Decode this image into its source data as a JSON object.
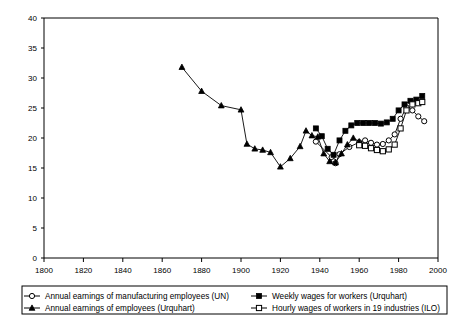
{
  "chart_data": {
    "type": "line",
    "title": "",
    "xlabel": "",
    "ylabel": "",
    "xlim": [
      1800,
      2000
    ],
    "ylim": [
      0,
      40
    ],
    "xticks": [
      1800,
      1820,
      1840,
      1860,
      1880,
      1900,
      1920,
      1940,
      1960,
      1980,
      2000
    ],
    "yticks": [
      0,
      5,
      10,
      15,
      20,
      25,
      30,
      35,
      40
    ],
    "grid": false,
    "legend_position": "bottom",
    "series": [
      {
        "name": "Annual earnings of manufacturing employees (UN)",
        "marker": "open-circle",
        "points": [
          [
            1938,
            19.4
          ],
          [
            1946,
            16.8
          ],
          [
            1947,
            16.1
          ],
          [
            1948,
            15.8
          ],
          [
            1950,
            17.3
          ],
          [
            1955,
            18.5
          ],
          [
            1960,
            19.3
          ],
          [
            1963,
            19.6
          ],
          [
            1966,
            19.2
          ],
          [
            1969,
            18.9
          ],
          [
            1972,
            19.0
          ],
          [
            1975,
            19.6
          ],
          [
            1978,
            20.6
          ],
          [
            1981,
            23.2
          ],
          [
            1984,
            25.1
          ],
          [
            1987,
            24.6
          ],
          [
            1990,
            23.6
          ],
          [
            1993,
            22.8
          ]
        ]
      },
      {
        "name": "Weekly wages for workers (Urquhart)",
        "marker": "filled-square",
        "points": [
          [
            1938,
            21.6
          ],
          [
            1941,
            20.3
          ],
          [
            1944,
            18.2
          ],
          [
            1947,
            17.2
          ],
          [
            1950,
            19.6
          ],
          [
            1953,
            21.2
          ],
          [
            1956,
            22.1
          ],
          [
            1959,
            22.5
          ],
          [
            1962,
            22.5
          ],
          [
            1965,
            22.5
          ],
          [
            1968,
            22.5
          ],
          [
            1971,
            22.4
          ],
          [
            1974,
            22.6
          ],
          [
            1977,
            23.2
          ],
          [
            1980,
            24.6
          ],
          [
            1983,
            25.6
          ],
          [
            1986,
            26.2
          ],
          [
            1989,
            26.4
          ],
          [
            1992,
            27.0
          ]
        ]
      },
      {
        "name": "Annual earnings of employees (Urquhart)",
        "marker": "filled-triangle",
        "points": [
          [
            1870,
            31.8
          ],
          [
            1880,
            27.8
          ],
          [
            1890,
            25.4
          ],
          [
            1900,
            24.7
          ],
          [
            1903,
            19.0
          ],
          [
            1907,
            18.2
          ],
          [
            1911,
            18.0
          ],
          [
            1915,
            17.6
          ],
          [
            1920,
            15.2
          ],
          [
            1925,
            16.6
          ],
          [
            1930,
            18.6
          ],
          [
            1933,
            21.2
          ],
          [
            1936,
            20.4
          ],
          [
            1939,
            20.2
          ],
          [
            1942,
            17.4
          ],
          [
            1945,
            16.1
          ],
          [
            1948,
            15.9
          ],
          [
            1951,
            17.4
          ],
          [
            1954,
            18.9
          ],
          [
            1957,
            20.0
          ],
          [
            1960,
            19.4
          ]
        ]
      },
      {
        "name": "Hourly wages of workers in 19 industries (ILO)",
        "marker": "open-square",
        "points": [
          [
            1960,
            18.8
          ],
          [
            1963,
            18.7
          ],
          [
            1966,
            18.3
          ],
          [
            1969,
            18.0
          ],
          [
            1972,
            17.8
          ],
          [
            1975,
            18.1
          ],
          [
            1978,
            18.9
          ],
          [
            1981,
            21.6
          ],
          [
            1984,
            24.6
          ],
          [
            1987,
            25.6
          ],
          [
            1990,
            25.8
          ],
          [
            1992,
            26.0
          ]
        ]
      }
    ]
  },
  "legend": {
    "entries": [
      {
        "label": "Annual earnings of manufacturing employees (UN)",
        "marker": "open-circle"
      },
      {
        "label": "Weekly wages for workers (Urquhart)",
        "marker": "filled-square"
      },
      {
        "label": "Annual earnings of employees (Urquhart)",
        "marker": "filled-triangle"
      },
      {
        "label": "Hourly wages of workers in 19 industries (ILO)",
        "marker": "open-square"
      }
    ]
  },
  "colors": {
    "line": "#000000",
    "axis": "#000000",
    "background": "#ffffff"
  }
}
